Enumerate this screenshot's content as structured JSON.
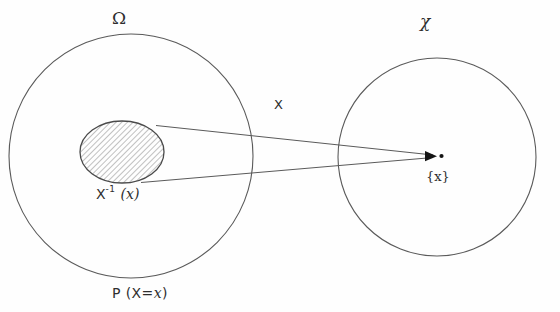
{
  "figure": {
    "type": "set-mapping-diagram",
    "background_color": "#fefefe",
    "stroke_color": "#5a5a5a",
    "text_color": "#2e2e2e"
  },
  "labels": {
    "domain_set": "Ω",
    "codomain_set": "χ",
    "random_variable": "X",
    "singleton": "{x}",
    "preimage_base": "X",
    "preimage_exponent": "-1",
    "preimage_argument": "(x)",
    "probability_prefix": "P",
    "probability_open": "(X=",
    "probability_value": "x",
    "probability_close": ")"
  },
  "shapes": {
    "domain_circle": {
      "cx": 131,
      "cy": 156,
      "r": 122
    },
    "codomain_circle": {
      "cx": 437,
      "cy": 157,
      "r": 99
    },
    "preimage_ellipse": {
      "cx": 122,
      "cy": 152,
      "rx": 42,
      "ry": 31,
      "fill": "hatched"
    },
    "arrow_target": {
      "x": 437,
      "y": 156
    },
    "cone_upper_start": {
      "x": 157,
      "y": 125
    },
    "cone_lower_start": {
      "x": 139,
      "y": 182
    }
  }
}
